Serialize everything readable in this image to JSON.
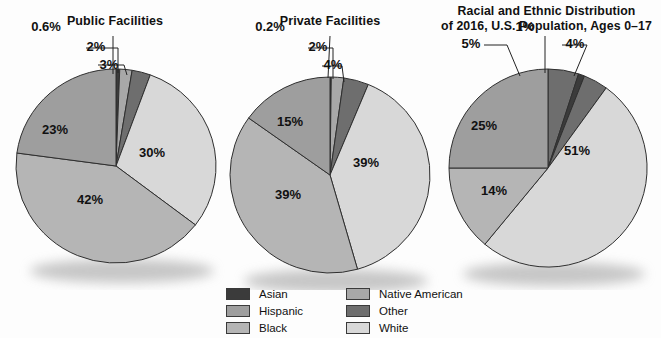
{
  "chart_data": [
    {
      "type": "pie",
      "title": "Public Facilities",
      "categories": [
        "Asian",
        "Native American",
        "Other",
        "White",
        "Black",
        "Hispanic"
      ],
      "values": [
        0.6,
        2,
        3,
        30,
        42,
        23
      ],
      "labels": [
        "0.6%",
        "2%",
        "3%",
        "30%",
        "42%",
        "23%"
      ],
      "colors": [
        "#3b3b3b",
        "#a8a8a8",
        "#6e6e6e",
        "#d8d8d8",
        "#b5b5b5",
        "#9e9e9e"
      ],
      "inside_labels": [
        {
          "text": "30%",
          "x": 152,
          "y": 157
        },
        {
          "text": "42%",
          "x": 90,
          "y": 204
        },
        {
          "text": "23%",
          "x": 55,
          "y": 134
        }
      ],
      "callouts": [
        {
          "text": "0.6%",
          "x": 46,
          "y": 31
        },
        {
          "text": "2%",
          "x": 96,
          "y": 51
        },
        {
          "text": "3%",
          "x": 109,
          "y": 69
        }
      ]
    },
    {
      "type": "pie",
      "title": "Private Facilities",
      "categories": [
        "Asian",
        "Native American",
        "Other",
        "White",
        "Black",
        "Hispanic"
      ],
      "values": [
        0.2,
        2,
        4,
        39,
        39,
        15
      ],
      "labels": [
        "0.2%",
        "2%",
        "4%",
        "39%",
        "39%",
        "15%"
      ],
      "colors": [
        "#3b3b3b",
        "#a8a8a8",
        "#6e6e6e",
        "#d8d8d8",
        "#b5b5b5",
        "#9e9e9e"
      ],
      "inside_labels": [
        {
          "text": "39%",
          "x": 146,
          "y": 167
        },
        {
          "text": "39%",
          "x": 68,
          "y": 199
        },
        {
          "text": "15%",
          "x": 70,
          "y": 126
        }
      ],
      "callouts": [
        {
          "text": "0.2%",
          "x": 50,
          "y": 31
        },
        {
          "text": "2%",
          "x": 98,
          "y": 51
        },
        {
          "text": "4%",
          "x": 113,
          "y": 69
        }
      ]
    },
    {
      "type": "pie",
      "title": "Racial and Ethnic Distribution of 2016, U.S. Population, Ages  0–17",
      "title_lines": [
        "Racial and Ethnic Distribution",
        "of 2016, U.S. Population, Ages  0–17"
      ],
      "categories": [
        "Asian",
        "Native American",
        "Other",
        "White",
        "Black",
        "Hispanic"
      ],
      "values": [
        5,
        1,
        4,
        51,
        14,
        25
      ],
      "labels": [
        "5%",
        "1%",
        "4%",
        "51%",
        "14%",
        "25%"
      ],
      "colors": [
        "#6e6e6e",
        "#3b3b3b",
        "#6e6e6e",
        "#d8d8d8",
        "#b5b5b5",
        "#9e9e9e"
      ],
      "inside_labels": [
        {
          "text": "51%",
          "x": 145,
          "y": 155
        },
        {
          "text": "14%",
          "x": 62,
          "y": 195
        },
        {
          "text": "25%",
          "x": 52,
          "y": 130
        }
      ],
      "callouts": [
        {
          "text": "5%",
          "x": 39,
          "y": 48
        },
        {
          "text": "1%",
          "x": 93,
          "y": 31
        },
        {
          "text": "4%",
          "x": 143,
          "y": 48
        }
      ]
    }
  ],
  "legend": {
    "left_column": [
      {
        "label": "Asian",
        "color": "#3b3b3b"
      },
      {
        "label": "Hispanic",
        "color": "#9e9e9e"
      },
      {
        "label": "Black",
        "color": "#b5b5b5"
      }
    ],
    "right_column": [
      {
        "label": "Native American",
        "color": "#a8a8a8"
      },
      {
        "label": "Other",
        "color": "#6e6e6e"
      },
      {
        "label": "White",
        "color": "#d8d8d8"
      }
    ]
  }
}
